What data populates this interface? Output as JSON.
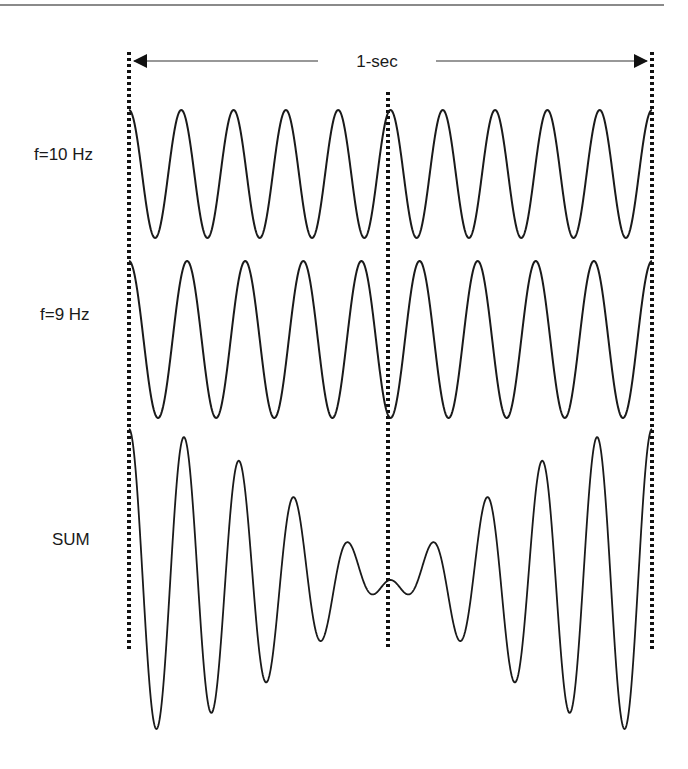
{
  "figure": {
    "span_label": "1-sec",
    "rows": [
      {
        "label": "f=10 Hz",
        "frequency_hz": 10
      },
      {
        "label": "f=9 Hz",
        "frequency_hz": 9
      },
      {
        "label": "SUM",
        "frequency_hz": null
      }
    ],
    "markers": [
      "start",
      "midpoint",
      "end"
    ]
  },
  "chart_data": {
    "type": "line",
    "title": "",
    "xlabel": "time (1-sec span)",
    "ylabel": "",
    "x_range": [
      0,
      1
    ],
    "grid": false,
    "series": [
      {
        "name": "f=10 Hz",
        "function": "cos(2*pi*10*t)",
        "cycles": 10,
        "amplitude": 1
      },
      {
        "name": "f=9 Hz",
        "function": "cos(2*pi*9*t)",
        "cycles": 9,
        "amplitude": 1
      },
      {
        "name": "SUM",
        "function": "cos(2*pi*10*t) + cos(2*pi*9*t)",
        "beat_frequency_hz": 1,
        "amplitude": 2,
        "min_envelope_at_t": 0.5
      }
    ],
    "annotations": [
      {
        "text": "1-sec",
        "type": "double-arrow",
        "from_t": 0,
        "to_t": 1
      },
      {
        "type": "dotted-vline",
        "t": 0
      },
      {
        "type": "dotted-vline",
        "t": 0.5
      },
      {
        "type": "dotted-vline",
        "t": 1
      }
    ]
  },
  "style": {
    "stroke": "#1a1a1a",
    "rule": "#8a8a8a"
  }
}
